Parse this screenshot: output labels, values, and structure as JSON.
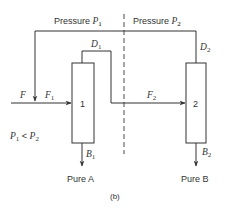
{
  "diagram": {
    "regions": {
      "left": {
        "label": "Pressure ",
        "var": "P",
        "sub": "1"
      },
      "right": {
        "label": "Pressure ",
        "var": "P",
        "sub": "2"
      }
    },
    "columns": [
      {
        "id": "1",
        "label": "1",
        "distillate": {
          "var": "D",
          "sub": "1"
        },
        "bottoms": {
          "var": "B",
          "sub": "1"
        },
        "product": "Pure A"
      },
      {
        "id": "2",
        "label": "2",
        "distillate": {
          "var": "D",
          "sub": "2"
        },
        "bottoms": {
          "var": "B",
          "sub": "2"
        },
        "product": "Pure B"
      }
    ],
    "streams": {
      "feed": {
        "var": "F"
      },
      "feed1": {
        "var": "F",
        "sub": "1"
      },
      "feed2": {
        "var": "F",
        "sub": "2"
      }
    },
    "condition": {
      "a": "P",
      "a_sub": "1",
      "op": " < ",
      "b": "P",
      "b_sub": "2"
    },
    "caption": "(b)",
    "colors": {
      "line": "#333333",
      "background": "#ffffff"
    }
  }
}
